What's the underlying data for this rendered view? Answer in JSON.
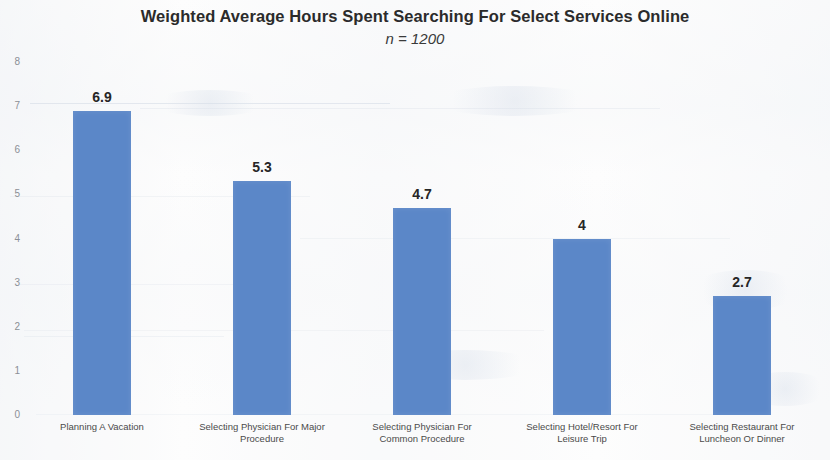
{
  "chart_data": {
    "type": "bar",
    "title": "Weighted Average Hours Spent Searching For Select Services Online",
    "subtitle": "n = 1200",
    "xlabel": "",
    "ylabel": "",
    "ylim": [
      0,
      8
    ],
    "yticks": [
      8,
      7,
      6,
      5,
      4,
      3,
      2,
      1,
      0
    ],
    "ytick_labels": [
      "8",
      "7",
      "6",
      "5",
      "4",
      "3",
      "2",
      "1",
      "0"
    ],
    "grid": false,
    "legend": false,
    "legend_position": "none",
    "bar_color": "#5b87c8",
    "categories": [
      "Planning A Vacation",
      "Selecting Physician For Major Procedure",
      "Selecting Physician For Common Procedure",
      "Selecting Hotel/Resort For Leisure Trip",
      "Selecting Restaurant For Luncheon Or Dinner"
    ],
    "category_lines": [
      [
        "Planning A Vacation",
        ""
      ],
      [
        "Selecting Physician For Major",
        "Procedure"
      ],
      [
        "Selecting Physician For",
        "Common Procedure"
      ],
      [
        "Selecting Hotel/Resort For",
        "Leisure Trip"
      ],
      [
        "Selecting Restaurant For",
        "Luncheon Or Dinner"
      ]
    ],
    "values": [
      6.9,
      5.3,
      4.7,
      4,
      2.7
    ],
    "data_labels": [
      "6.9",
      "5.3",
      "4.7",
      "4",
      "2.7"
    ]
  }
}
